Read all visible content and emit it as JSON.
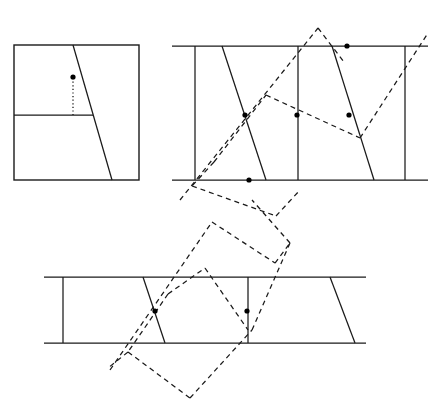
{
  "figure": {
    "title": "",
    "canvas": {
      "width": 431,
      "height": 413
    },
    "colors": {
      "background": "#ffffff",
      "ink": "#1a1a1a",
      "dot": "#000000"
    },
    "stroke_styles": {
      "solid": "solid",
      "dashed": "5 4",
      "dotted": "1.2 2.4"
    },
    "panels": [
      {
        "name": "panel-square",
        "label": "",
        "frame": {
          "x": 14,
          "y": 45,
          "width": 125,
          "height": 135
        },
        "segments": [
          {
            "name": "transversal",
            "style": "solid",
            "x1": 73,
            "y1": 45,
            "x2": 112,
            "y2": 180
          },
          {
            "name": "interior-horizontal",
            "style": "solid",
            "x1": 14,
            "y1": 115,
            "x2": 93,
            "y2": 115
          },
          {
            "name": "drop-perpendicular",
            "style": "dotted",
            "x1": 73,
            "y1": 78,
            "x2": 73,
            "y2": 115
          }
        ],
        "dots": [
          {
            "name": "marked-point",
            "cx": 73,
            "cy": 77,
            "r": 2.6
          }
        ]
      },
      {
        "name": "panel-strip-top",
        "label": "",
        "rails": [
          {
            "name": "rail-top",
            "style": "solid",
            "x1": 172,
            "y1": 46,
            "x2": 428,
            "y2": 46
          },
          {
            "name": "rail-bottom",
            "style": "solid",
            "x1": 172,
            "y1": 180,
            "x2": 428,
            "y2": 180
          }
        ],
        "segments": [
          {
            "name": "vertical-left",
            "style": "solid",
            "x1": 195,
            "y1": 46,
            "x2": 195,
            "y2": 180
          },
          {
            "name": "vertical-middle",
            "style": "solid",
            "x1": 298,
            "y1": 46,
            "x2": 298,
            "y2": 180
          },
          {
            "name": "vertical-right",
            "style": "solid",
            "x1": 405,
            "y1": 46,
            "x2": 405,
            "y2": 180
          },
          {
            "name": "slant-left",
            "style": "solid",
            "x1": 222,
            "y1": 46,
            "x2": 266,
            "y2": 180
          },
          {
            "name": "slant-right",
            "style": "solid",
            "x1": 332,
            "y1": 46,
            "x2": 374,
            "y2": 180
          },
          {
            "name": "dashed-ray-lower-left",
            "style": "dashed",
            "x1": 180,
            "y1": 200,
            "x2": 318,
            "y2": 28
          },
          {
            "name": "dashed-ray-upper-right",
            "style": "dashed",
            "x1": 318,
            "y1": 28,
            "x2": 344,
            "y2": 62
          },
          {
            "name": "dashed-zig-a",
            "style": "dashed",
            "x1": 214,
            "y1": 162,
            "x2": 266,
            "y2": 95
          },
          {
            "name": "dashed-zig-b",
            "style": "dashed",
            "x1": 266,
            "y1": 95,
            "x2": 360,
            "y2": 138
          },
          {
            "name": "dashed-zig-c",
            "style": "dashed",
            "x1": 360,
            "y1": 138,
            "x2": 428,
            "y2": 33
          },
          {
            "name": "dashed-zig-d",
            "style": "dashed",
            "x1": 214,
            "y1": 162,
            "x2": 192,
            "y2": 186
          },
          {
            "name": "dashed-zig-e",
            "style": "dashed",
            "x1": 192,
            "y1": 186,
            "x2": 276,
            "y2": 216
          },
          {
            "name": "dashed-zig-f",
            "style": "dashed",
            "x1": 276,
            "y1": 216,
            "x2": 300,
            "y2": 190
          }
        ],
        "dots": [
          {
            "name": "intersection-left",
            "cx": 245,
            "cy": 115,
            "r": 2.6
          },
          {
            "name": "intersection-middle",
            "cx": 297,
            "cy": 115,
            "r": 2.6
          },
          {
            "name": "intersection-right",
            "cx": 349,
            "cy": 115,
            "r": 2.6
          },
          {
            "name": "intersection-bottom",
            "cx": 249,
            "cy": 180,
            "r": 2.6
          },
          {
            "name": "intersection-top",
            "cx": 347,
            "cy": 46,
            "r": 2.6
          }
        ]
      },
      {
        "name": "panel-strip-bottom",
        "label": "",
        "rails": [
          {
            "name": "rail-top",
            "style": "solid",
            "x1": 44,
            "y1": 277,
            "x2": 366,
            "y2": 277
          },
          {
            "name": "rail-bottom",
            "style": "solid",
            "x1": 44,
            "y1": 343,
            "x2": 366,
            "y2": 343
          }
        ],
        "segments": [
          {
            "name": "vertical-left",
            "style": "solid",
            "x1": 63,
            "y1": 277,
            "x2": 63,
            "y2": 343
          },
          {
            "name": "vertical-middle",
            "style": "solid",
            "x1": 248,
            "y1": 277,
            "x2": 248,
            "y2": 343
          },
          {
            "name": "slant-left",
            "style": "solid",
            "x1": 143,
            "y1": 277,
            "x2": 165,
            "y2": 343
          },
          {
            "name": "slant-right",
            "style": "solid",
            "x1": 330,
            "y1": 277,
            "x2": 355,
            "y2": 343
          },
          {
            "name": "dashed-long-diagonal",
            "style": "dashed",
            "x1": 110,
            "y1": 370,
            "x2": 212,
            "y2": 222
          },
          {
            "name": "dashed-zig-a",
            "style": "dashed",
            "x1": 212,
            "y1": 222,
            "x2": 275,
            "y2": 263
          },
          {
            "name": "dashed-zig-b",
            "style": "dashed",
            "x1": 275,
            "y1": 263,
            "x2": 290,
            "y2": 243
          },
          {
            "name": "dashed-zig-c",
            "style": "dashed",
            "x1": 290,
            "y1": 243,
            "x2": 252,
            "y2": 200
          },
          {
            "name": "dashed-inner-a",
            "style": "dashed",
            "x1": 168,
            "y1": 294,
            "x2": 205,
            "y2": 268
          },
          {
            "name": "dashed-inner-b",
            "style": "dashed",
            "x1": 205,
            "y1": 268,
            "x2": 248,
            "y2": 330
          },
          {
            "name": "dashed-inner-c",
            "style": "dashed",
            "x1": 168,
            "y1": 294,
            "x2": 128,
            "y2": 352
          },
          {
            "name": "dashed-inner-d",
            "style": "dashed",
            "x1": 128,
            "y1": 352,
            "x2": 108,
            "y2": 368
          },
          {
            "name": "dashed-lower-a",
            "style": "dashed",
            "x1": 128,
            "y1": 352,
            "x2": 190,
            "y2": 398
          },
          {
            "name": "dashed-lower-b",
            "style": "dashed",
            "x1": 190,
            "y1": 398,
            "x2": 252,
            "y2": 330
          },
          {
            "name": "dashed-lower-c",
            "style": "dashed",
            "x1": 252,
            "y1": 330,
            "x2": 290,
            "y2": 243
          }
        ],
        "dots": [
          {
            "name": "intersection-left",
            "cx": 155,
            "cy": 311,
            "r": 2.6
          },
          {
            "name": "intersection-middle",
            "cx": 247,
            "cy": 311,
            "r": 2.6
          }
        ]
      }
    ]
  }
}
